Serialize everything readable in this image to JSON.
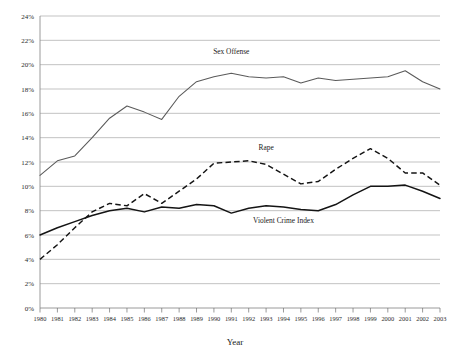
{
  "chart_data": {
    "type": "line",
    "title": "",
    "xlabel": "Year",
    "ylabel": "",
    "ylim": [
      0,
      24
    ],
    "xlim": [
      1980,
      2003
    ],
    "grid": true,
    "legend_position": "inline-annotations",
    "ytick_labels": [
      "0%",
      "2%",
      "4%",
      "6%",
      "8%",
      "10%",
      "12%",
      "14%",
      "16%",
      "18%",
      "20%",
      "22%",
      "24%"
    ],
    "ytick_values": [
      0,
      2,
      4,
      6,
      8,
      10,
      12,
      14,
      16,
      18,
      20,
      22,
      24
    ],
    "categories": [
      1980,
      1981,
      1982,
      1983,
      1984,
      1985,
      1986,
      1987,
      1988,
      1989,
      1990,
      1991,
      1992,
      1993,
      1994,
      1995,
      1996,
      1997,
      1998,
      1999,
      2000,
      2001,
      2002,
      2003
    ],
    "xtick_labels": [
      "1980",
      "1981",
      "1982",
      "1983",
      "1984",
      "1985",
      "1986",
      "1987",
      "1988",
      "1989",
      "1990",
      "1991",
      "1992",
      "1993",
      "1994",
      "1995",
      "1996",
      "1997",
      "1998",
      "1999",
      "2000",
      "2001",
      "2002",
      "2003"
    ],
    "series": [
      {
        "name": "Sex Offense",
        "style": "solid",
        "color": "#5a5a5a",
        "label_x": 1991,
        "label_y": 20.9,
        "values": [
          10.9,
          12.1,
          12.5,
          14.0,
          15.6,
          16.6,
          16.1,
          15.5,
          17.4,
          18.6,
          19.0,
          19.3,
          19.0,
          18.9,
          19.0,
          18.5,
          18.9,
          18.7,
          18.8,
          18.9,
          19.0,
          19.5,
          18.6,
          18.0
        ]
      },
      {
        "name": "Rape",
        "style": "dashed",
        "color": "#141414",
        "label_x": 1993,
        "label_y": 13.0,
        "values": [
          4.0,
          5.2,
          6.6,
          7.9,
          8.6,
          8.4,
          9.4,
          8.6,
          9.6,
          10.6,
          11.9,
          12.0,
          12.1,
          11.8,
          11.0,
          10.2,
          10.4,
          11.4,
          12.3,
          13.1,
          12.3,
          11.1,
          11.1,
          10.1
        ]
      },
      {
        "name": "Violent Crime Index",
        "style": "solid-bold",
        "color": "#141414",
        "label_x": 1994,
        "label_y": 7.0,
        "values": [
          6.0,
          6.6,
          7.1,
          7.6,
          8.0,
          8.2,
          7.9,
          8.3,
          8.2,
          8.5,
          8.4,
          7.8,
          8.2,
          8.4,
          8.3,
          8.1,
          8.0,
          8.5,
          9.3,
          10.0,
          10.0,
          10.1,
          9.6,
          9.0
        ]
      }
    ]
  }
}
